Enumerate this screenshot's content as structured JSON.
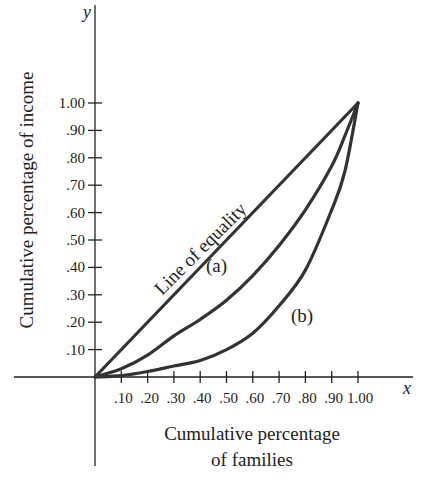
{
  "chart_data": {
    "type": "line",
    "title": "",
    "xlabel": "Cumulative percentage of families",
    "xlabel_lines": [
      "Cumulative percentage",
      "of families"
    ],
    "ylabel": "Cumulative percentage of income",
    "x_var": "x",
    "y_var": "y",
    "xlim": [
      0,
      1.0
    ],
    "ylim": [
      0,
      1.0
    ],
    "grid": false,
    "x_ticks": [
      0.1,
      0.2,
      0.3,
      0.4,
      0.5,
      0.6,
      0.7,
      0.8,
      0.9,
      1.0
    ],
    "x_tick_labels": [
      ".10",
      ".20",
      ".30",
      ".40",
      ".50",
      ".60",
      ".70",
      ".80",
      ".90",
      "1.00"
    ],
    "y_ticks": [
      0.1,
      0.2,
      0.3,
      0.4,
      0.5,
      0.6,
      0.7,
      0.8,
      0.9,
      1.0
    ],
    "y_tick_labels": [
      ".10",
      ".20",
      ".30",
      ".40",
      ".50",
      ".60",
      ".70",
      ".80",
      ".90",
      "1.00"
    ],
    "x": [
      0,
      0.1,
      0.2,
      0.3,
      0.4,
      0.5,
      0.6,
      0.7,
      0.8,
      0.9,
      0.95,
      1.0
    ],
    "series": [
      {
        "name": "Line of equality",
        "label": "Line of equality",
        "values": [
          0,
          0.1,
          0.2,
          0.3,
          0.4,
          0.5,
          0.6,
          0.7,
          0.8,
          0.9,
          0.95,
          1.0
        ]
      },
      {
        "name": "(a)",
        "label": "(a)",
        "values": [
          0,
          0.03,
          0.08,
          0.15,
          0.21,
          0.28,
          0.37,
          0.48,
          0.61,
          0.77,
          0.88,
          1.0
        ]
      },
      {
        "name": "(b)",
        "label": "(b)",
        "values": [
          0,
          0.005,
          0.02,
          0.04,
          0.06,
          0.1,
          0.16,
          0.26,
          0.39,
          0.61,
          0.75,
          1.0
        ]
      }
    ],
    "annotations": [
      {
        "text": "Line of equality",
        "series": "Line of equality"
      },
      {
        "text": "(a)",
        "series": "(a)"
      },
      {
        "text": "(b)",
        "series": "(b)"
      }
    ]
  }
}
